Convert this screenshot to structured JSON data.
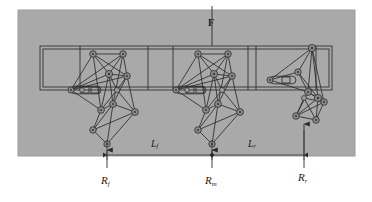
{
  "figure": {
    "background_color": "#ffffff",
    "panel_color": "#a9a9a9",
    "line_color": "#2b2b2b",
    "joint_fill": "#8c8c8c"
  },
  "labels": {
    "force": {
      "symbol": "F",
      "name": "applied-force"
    },
    "span_front": {
      "symbol": "L",
      "subscript": "f",
      "name": "front-span"
    },
    "span_rear": {
      "symbol": "L",
      "subscript": "r",
      "name": "rear-span"
    },
    "reaction_front": {
      "symbol": "R",
      "subscript": "f",
      "name": "front-reaction"
    },
    "reaction_mid": {
      "symbol": "R",
      "subscript": "m",
      "name": "middle-reaction"
    },
    "reaction_rear": {
      "symbol": "R",
      "subscript": "r",
      "name": "rear-reaction"
    }
  },
  "geometry": {
    "panel": {
      "x": 18,
      "y": 10,
      "w": 337,
      "h": 146
    },
    "rail": {
      "x": 40,
      "y": 46,
      "w": 292,
      "h": 44
    },
    "force_arrow": {
      "x": 212,
      "y_top": 8,
      "y_bottom": 46
    },
    "reaction_points": {
      "front_x": 107,
      "mid_x": 212,
      "rear_x": 304,
      "y": 158
    },
    "dimension_line_y": 155,
    "mechanisms": [
      {
        "name": "front-mechanism",
        "anchor_x": 107,
        "state": "extended"
      },
      {
        "name": "middle-mechanism",
        "anchor_x": 212,
        "state": "extended"
      },
      {
        "name": "rear-mechanism",
        "anchor_x": 304,
        "state": "retracted"
      }
    ]
  }
}
